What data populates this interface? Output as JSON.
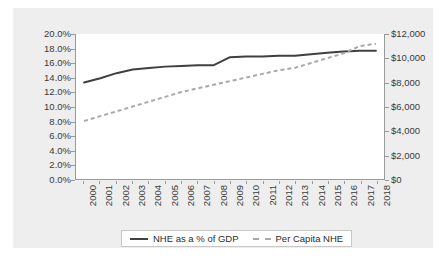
{
  "chart_data": {
    "type": "line",
    "title": "",
    "xlabel": "",
    "ylabel": "",
    "grid": false,
    "legend_position": "bottom",
    "categories": [
      "2000",
      "2001",
      "2002",
      "2003",
      "2004",
      "2005",
      "2006",
      "2007",
      "2008",
      "2009",
      "2010",
      "2011",
      "2012",
      "2013",
      "2014",
      "2015",
      "2016",
      "2017",
      "2018"
    ],
    "axes": {
      "left": {
        "label": "NHE as a % of GDP",
        "ylim": [
          0.0,
          20.0
        ],
        "tick_step": 2.0,
        "ticks": [
          "0.0%",
          "2.0%",
          "4.0%",
          "6.0%",
          "8.0%",
          "10.0%",
          "12.0%",
          "14.0%",
          "16.0%",
          "18.0%",
          "20.0%"
        ]
      },
      "right": {
        "label": "Per Capita NHE",
        "ylim": [
          0,
          12000
        ],
        "tick_step": 2000,
        "ticks": [
          "$0",
          "$2,000",
          "$4,000",
          "$6,000",
          "$8,000",
          "$10,000",
          "$12,000"
        ]
      }
    },
    "series": [
      {
        "name": "NHE as a % of GDP",
        "axis": "left",
        "style": "solid",
        "color": "#404040",
        "values": [
          13.3,
          13.9,
          14.6,
          15.1,
          15.3,
          15.5,
          15.6,
          15.7,
          15.7,
          16.8,
          16.9,
          16.9,
          17.0,
          17.0,
          17.2,
          17.4,
          17.6,
          17.7,
          17.7
        ]
      },
      {
        "name": "Per Capita NHE",
        "axis": "right",
        "style": "dashed",
        "color": "#a8a8a8",
        "values": [
          4800,
          5200,
          5600,
          6000,
          6400,
          6800,
          7200,
          7500,
          7800,
          8100,
          8400,
          8700,
          9000,
          9200,
          9600,
          10000,
          10400,
          11000,
          11200
        ]
      }
    ]
  },
  "legend": {
    "entries": [
      {
        "label": "NHE as a % of GDP",
        "marker": "solid-line-icon"
      },
      {
        "label": "Per Capita NHE",
        "marker": "dashed-line-icon"
      }
    ]
  },
  "colors": {
    "panel_background": "#eeeeee",
    "plot_background": "#ffffff",
    "axis_line": "#9a9a9a",
    "series_solid": "#404040",
    "series_dashed": "#a8a8a8",
    "text": "#3a3a3a"
  }
}
